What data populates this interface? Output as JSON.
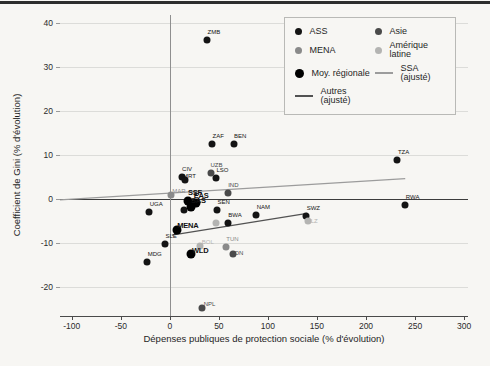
{
  "chart_data": {
    "type": "scatter",
    "title": "",
    "xlabel": "Dépenses publiques de protection sociale (% d'évolution)",
    "ylabel": "Coefficient de Gini (% d'évolution)",
    "x_ticks": [
      -100,
      -50,
      0,
      50,
      100,
      150,
      200,
      250,
      300
    ],
    "y_ticks": [
      40,
      30,
      20,
      10,
      0,
      -10,
      -20
    ],
    "x_range": [
      -112,
      304
    ],
    "y_range": [
      -26.6,
      41.8
    ],
    "grid": "horizontal",
    "zero_lines": {
      "horizontal": 0,
      "vertical": 0
    },
    "colors": {
      "ass": "#141414",
      "asie": "#4a4a4a",
      "mena": "#8a8a8a",
      "amlat": "#b4b4b2",
      "regional": "#000000",
      "ssa_line": "#9c9c9c",
      "autres_line": "#525252"
    },
    "series": [
      {
        "name": "ASS",
        "color": "#141414",
        "points": [
          [
            "ZMB",
            38,
            36.2
          ],
          [
            "ZAF",
            43,
            12.4
          ],
          [
            "BEN",
            65,
            12.4
          ],
          [
            "TZA",
            232,
            8.9
          ],
          [
            "RWA",
            240,
            -1.3
          ],
          [
            "UGA",
            -21,
            -3.0
          ],
          [
            "SLE",
            -5,
            -10.2
          ],
          [
            "MDG",
            -23,
            -14.3
          ],
          [
            "CIV",
            12,
            5.0
          ],
          [
            "MRT",
            15,
            4.2,
            {
              "dx": 2,
              "dy": -4
            }
          ],
          [
            "LSO",
            47,
            4.8
          ],
          [
            "SEN",
            48,
            -2.6
          ],
          [
            "BWA",
            59,
            -5.5
          ],
          [
            "NAM",
            88,
            -3.7
          ],
          [
            "SWZ",
            139,
            -3.9
          ],
          [
            "",
            14,
            -2.6
          ]
        ]
      },
      {
        "name": "Asie",
        "color": "#4a4a4a",
        "points": [
          [
            "UZB",
            42,
            6.0,
            {
              "dx": 3,
              "dy": -8
            }
          ],
          [
            "IND",
            59,
            1.4
          ],
          [
            "IDN",
            64,
            -12.4,
            {
              "dx": 4,
              "dy": -1
            }
          ],
          [
            "NPL",
            33,
            -24.8,
            {
              "dx": 5,
              "dy": -4
            }
          ]
        ]
      },
      {
        "name": "MENA",
        "color": "#8a8a8a",
        "points": [
          [
            "MAR",
            1,
            0.9,
            {
              "dx": 5,
              "dy": -4
            }
          ],
          [
            "TUN",
            57,
            -11.0
          ]
        ]
      },
      {
        "name": "Amérique latine",
        "color": "#b4b4b2",
        "points": [
          [
            "BOL",
            31,
            -10.6,
            {
              "dx": 5,
              "dy": -4
            }
          ],
          [
            "BLZ",
            141,
            -4.9,
            {
              "dx": 2,
              "dy": 0
            }
          ],
          [
            "",
            47,
            -5.5
          ]
        ]
      },
      {
        "name": "Moy. régionale",
        "color": "#000000",
        "big": true,
        "points": [
          [
            "SSF",
            19,
            -0.4
          ],
          [
            "EAS",
            27,
            -1.0,
            {
              "dx": 2,
              "dy": -7
            }
          ],
          [
            "SAS",
            22,
            -1.8,
            {
              "dx": 4,
              "dy": -6
            }
          ],
          [
            "MENA",
            7,
            -7.0,
            {
              "dx": 5,
              "dy": -4
            }
          ],
          [
            "WLD",
            22,
            -12.5,
            {
              "dx": 5,
              "dy": -3
            }
          ]
        ]
      }
    ],
    "lines": [
      {
        "name": "SSA (ajusté)",
        "color": "#9c9c9c",
        "x1": -112,
        "y1": -0.2,
        "x2": 240,
        "y2": 4.6
      },
      {
        "name": "Autres (ajusté)",
        "color": "#525252",
        "x1": 2,
        "y1": -8.2,
        "x2": 140,
        "y2": -3.3
      }
    ],
    "legend": {
      "position": "top-right",
      "items": [
        {
          "type": "dot",
          "color": "#141414",
          "label": "ASS"
        },
        {
          "type": "dot",
          "color": "#4a4a4a",
          "label": "Asie"
        },
        {
          "type": "dot",
          "color": "#8a8a8a",
          "label": "MENA"
        },
        {
          "type": "dot",
          "color": "#b4b4b2",
          "label": "Amérique latine"
        },
        {
          "type": "dot-big",
          "color": "#000000",
          "label": "Moy. régionale"
        },
        {
          "type": "line",
          "color": "#9c9c9c",
          "label": "SSA (ajusté)"
        },
        {
          "type": "line",
          "color": "#525252",
          "label": "Autres (ajusté)"
        }
      ]
    }
  }
}
